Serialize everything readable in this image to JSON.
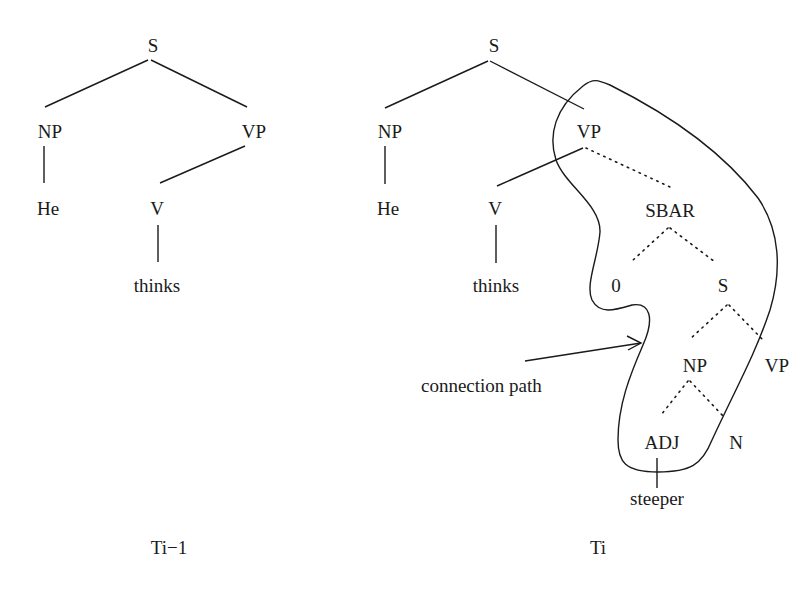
{
  "diagram": {
    "type": "parse-tree-comparison",
    "trees": [
      {
        "caption": "Ti−1",
        "nodes": {
          "S": "S",
          "NP": "NP",
          "VP": "VP",
          "He": "He",
          "V": "V",
          "thinks": "thinks"
        },
        "edges": [
          [
            "S",
            "NP",
            "solid"
          ],
          [
            "S",
            "VP",
            "solid"
          ],
          [
            "NP",
            "He",
            "solid"
          ],
          [
            "VP",
            "V",
            "solid"
          ],
          [
            "V",
            "thinks",
            "solid"
          ]
        ]
      },
      {
        "caption": "Ti",
        "nodes": {
          "S": "S",
          "NP": "NP",
          "VP": "VP",
          "He": "He",
          "V": "V",
          "thinks": "thinks",
          "SBAR": "SBAR",
          "zero": "0",
          "S2": "S",
          "NP2": "NP",
          "VP2": "VP",
          "ADJ": "ADJ",
          "N": "N",
          "steeper": "steeper"
        },
        "edges": [
          [
            "S",
            "NP",
            "solid"
          ],
          [
            "S",
            "VP",
            "solid"
          ],
          [
            "NP",
            "He",
            "solid"
          ],
          [
            "VP",
            "V",
            "solid"
          ],
          [
            "V",
            "thinks",
            "solid"
          ],
          [
            "VP",
            "SBAR",
            "dotted"
          ],
          [
            "SBAR",
            "0",
            "dotted"
          ],
          [
            "SBAR",
            "S2",
            "dotted"
          ],
          [
            "S2",
            "NP2",
            "dotted"
          ],
          [
            "S2",
            "VP2",
            "dotted"
          ],
          [
            "NP2",
            "ADJ",
            "dotted"
          ],
          [
            "NP2",
            "N",
            "dotted"
          ],
          [
            "ADJ",
            "steeper",
            "solid"
          ]
        ],
        "annotation": {
          "label": "connection path",
          "encloses": [
            "VP",
            "SBAR",
            "S2",
            "NP2",
            "ADJ"
          ]
        }
      }
    ]
  }
}
